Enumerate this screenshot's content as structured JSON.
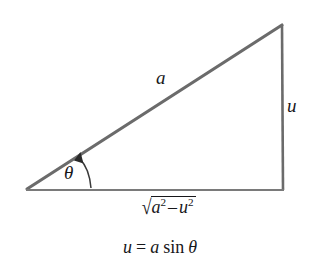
{
  "figure": {
    "type": "right-triangle-trigonometric-substitution-diagram",
    "background_color": "#ffffff",
    "stroke_color": "#6b6b6b",
    "text_color": "#17171a",
    "width": 320,
    "height": 265
  },
  "triangle": {
    "vertices": {
      "left": {
        "x": 26,
        "y": 190
      },
      "top_right": {
        "x": 282,
        "y": 24
      },
      "bottom_right": {
        "x": 283,
        "y": 190
      }
    },
    "right_angle_at": "bottom_right"
  },
  "labels": {
    "hypotenuse": "a",
    "vertical_side": "u",
    "angle": "θ",
    "base": {
      "radical_sign": "√",
      "radicand_first_base": "a",
      "radicand_first_exponent": "2",
      "operator": "–",
      "radicand_second_base": "u",
      "radicand_second_exponent": "2",
      "plain": "√(a² – u²)"
    }
  },
  "equation": {
    "lhs": "u",
    "equals": "=",
    "coefficient": "a",
    "function": "sin",
    "argument": "θ",
    "plain": "u = a sin θ"
  },
  "angle_arc": {
    "description": "curved arrow from base up to hypotenuse indicating angle theta",
    "arrow_head": "filled-triangle"
  }
}
